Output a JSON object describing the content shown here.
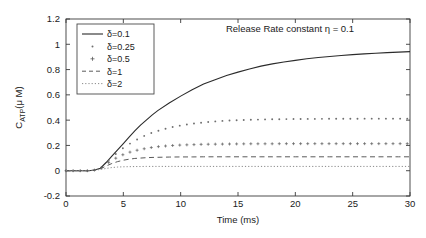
{
  "chart_data": {
    "type": "line",
    "title": "Release Rate constant η = 0.1",
    "xlabel": "Time (ms)",
    "ylabel": "C_ATP(μ M)",
    "ylabel_main": "C",
    "ylabel_sub": "ATP",
    "ylabel_rest": "(μ M)",
    "xlim": [
      0,
      30
    ],
    "ylim": [
      -0.2,
      1.2
    ],
    "xticks": [
      0,
      5,
      10,
      15,
      20,
      25,
      30
    ],
    "xticklabels": [
      "0",
      "5",
      "10",
      "15",
      "20",
      "25",
      "30"
    ],
    "yticks": [
      -0.2,
      0,
      0.2,
      0.4,
      0.6,
      0.8,
      1,
      1.2
    ],
    "yticklabels": [
      "-0.2",
      "0",
      "0.2",
      "0.4",
      "0.6",
      "0.8",
      "1",
      "1.2"
    ],
    "grid": false,
    "legend_position": "upper-left",
    "x": [
      0,
      1,
      2,
      2.5,
      3,
      3.5,
      4,
      4.5,
      5,
      5.5,
      6,
      6.5,
      7,
      7.5,
      8,
      9,
      10,
      11,
      12,
      13,
      14,
      15,
      16,
      17,
      18,
      19,
      20,
      21,
      22,
      23,
      24,
      25,
      26,
      27,
      28,
      29,
      30
    ],
    "series": [
      {
        "name": "δ=0.1",
        "label": "δ=0.1",
        "linestyle": "solid",
        "color": "#2b2b2b",
        "values": [
          0,
          0,
          0,
          0.005,
          0.02,
          0.065,
          0.115,
          0.165,
          0.215,
          0.265,
          0.315,
          0.36,
          0.4,
          0.44,
          0.475,
          0.535,
          0.59,
          0.64,
          0.685,
          0.72,
          0.753,
          0.78,
          0.805,
          0.827,
          0.845,
          0.86,
          0.873,
          0.885,
          0.895,
          0.903,
          0.911,
          0.918,
          0.924,
          0.929,
          0.934,
          0.938,
          0.942
        ]
      },
      {
        "name": "δ=0.25",
        "label": "δ=0.25",
        "linestyle": "dotted-marker",
        "marker": "point",
        "color": "#6e6e6e",
        "values": [
          0,
          0,
          0,
          0.005,
          0.02,
          0.06,
          0.105,
          0.145,
          0.18,
          0.21,
          0.237,
          0.262,
          0.283,
          0.3,
          0.315,
          0.34,
          0.358,
          0.372,
          0.382,
          0.39,
          0.396,
          0.4,
          0.403,
          0.405,
          0.407,
          0.408,
          0.409,
          0.41,
          0.41,
          0.411,
          0.411,
          0.411,
          0.412,
          0.412,
          0.412,
          0.412,
          0.412
        ]
      },
      {
        "name": "δ=0.5",
        "label": "δ=0.5",
        "linestyle": "marker-plus",
        "marker": "plus",
        "color": "#5a5a5a",
        "values": [
          0,
          0,
          0,
          0.005,
          0.018,
          0.05,
          0.082,
          0.107,
          0.128,
          0.145,
          0.158,
          0.168,
          0.177,
          0.184,
          0.19,
          0.198,
          0.203,
          0.206,
          0.209,
          0.21,
          0.211,
          0.212,
          0.213,
          0.213,
          0.213,
          0.214,
          0.214,
          0.214,
          0.214,
          0.214,
          0.214,
          0.214,
          0.214,
          0.214,
          0.214,
          0.214,
          0.214
        ]
      },
      {
        "name": "δ=1",
        "label": "δ=1",
        "linestyle": "dashed",
        "color": "#5a5a5a",
        "values": [
          0,
          0,
          0,
          0.004,
          0.015,
          0.037,
          0.057,
          0.072,
          0.083,
          0.091,
          0.097,
          0.1,
          0.103,
          0.105,
          0.106,
          0.108,
          0.109,
          0.109,
          0.11,
          0.11,
          0.11,
          0.11,
          0.11,
          0.11,
          0.11,
          0.11,
          0.11,
          0.11,
          0.11,
          0.11,
          0.11,
          0.11,
          0.11,
          0.11,
          0.11,
          0.11,
          0.11
        ]
      },
      {
        "name": "δ=2",
        "label": "δ=2",
        "linestyle": "dotted",
        "color": "#8a8a8a",
        "values": [
          0,
          0,
          0,
          0.003,
          0.01,
          0.018,
          0.025,
          0.029,
          0.031,
          0.032,
          0.033,
          0.033,
          0.034,
          0.034,
          0.034,
          0.034,
          0.034,
          0.034,
          0.034,
          0.034,
          0.034,
          0.034,
          0.034,
          0.034,
          0.034,
          0.034,
          0.034,
          0.034,
          0.034,
          0.034,
          0.034,
          0.034,
          0.034,
          0.034,
          0.034,
          0.034,
          0.034
        ]
      }
    ]
  }
}
